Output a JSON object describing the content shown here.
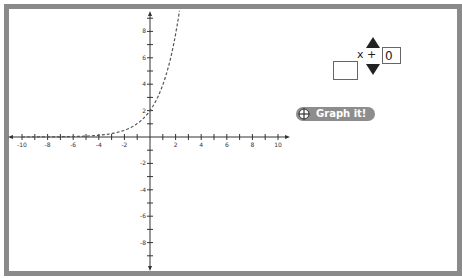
{
  "graph": {
    "function_description": "exponential curve (dashed)",
    "x_ticks": [
      -10,
      -8,
      -6,
      -4,
      -2,
      2,
      4,
      6,
      8,
      10
    ],
    "y_ticks": [
      8,
      6,
      4,
      2,
      -2,
      -4,
      -6,
      -8
    ],
    "x_range": [
      -10,
      10
    ],
    "y_range": [
      -9,
      9
    ],
    "curve_style": "dashed",
    "y_intercept": 2
  },
  "controls": {
    "operator_text": "x +",
    "offset_value": "0",
    "coefficient_value": "",
    "graph_button_label": "Graph it!",
    "graph_button_icon": "crosshair-icon"
  },
  "colors": {
    "frame": "#8a8a8a",
    "button": "#8d8d8d",
    "axis": "#333333"
  }
}
